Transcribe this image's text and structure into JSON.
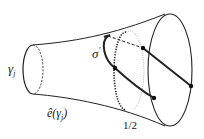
{
  "diagram": {
    "type": "flared tube / trumpet surface with curves",
    "labels": {
      "gamma": "γ",
      "gamma_sub": "j",
      "sigma": "σ",
      "sigma_prime": "′",
      "hat_e_prefix": "ê",
      "hat_e_arg": "(γ",
      "hat_e_sub": "j",
      "hat_e_close": ")",
      "half": "1/2"
    },
    "colors": {
      "stroke": "#222222",
      "light_dots": "#888888",
      "background": "#ffffff"
    },
    "points": [
      {
        "name": "point-upper-mid",
        "x": 143,
        "y": 48
      },
      {
        "name": "point-left-mid",
        "x": 115,
        "y": 68
      },
      {
        "name": "point-lower-mid",
        "x": 154,
        "y": 98
      },
      {
        "name": "point-right-rim",
        "x": 191,
        "y": 86
      }
    ]
  }
}
